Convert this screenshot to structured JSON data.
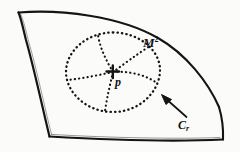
{
  "figure": {
    "kind": "hand-drawn-geometry-diagram",
    "background_color": "#fbfbfa",
    "ink_color": "#141414",
    "labels": {
      "manifold": "M",
      "manifold_exponent": "2",
      "point": "p",
      "circle": "C",
      "circle_subscript": "r"
    },
    "elements": {
      "surface_patch_name": "curved quadrilateral surface patch",
      "geodesic_circle_name": "dotted geodesic circle",
      "center_mark": "+",
      "spoke_count": 5,
      "pointer_arrow": "arrow from C_r label to geodesic circle"
    },
    "geometry": {
      "center_point": [
        113,
        72
      ],
      "circle_radius_x": 47,
      "circle_radius_y": 40,
      "arrow_tip": [
        162,
        96
      ],
      "arrow_tail": [
        186,
        117
      ]
    }
  }
}
